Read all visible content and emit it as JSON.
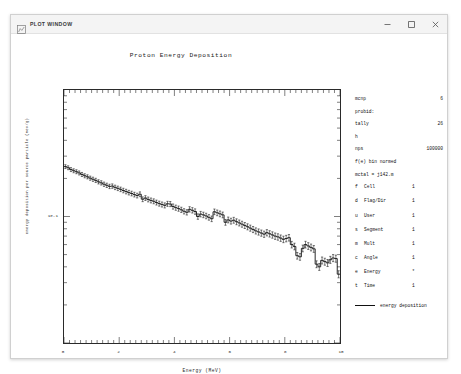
{
  "window": {
    "title": "PLOT WINDOW",
    "icon": "plot-window-icon",
    "minimize_label": "–",
    "maximize_label": "□",
    "close_label": "✕"
  },
  "info": {
    "rows": [
      {
        "key": "mcnp",
        "value": "6"
      },
      {
        "key": "probid:",
        "value": ""
      },
      {
        "key": "tally",
        "value": "26"
      },
      {
        "key": "h",
        "value": ""
      }
    ],
    "nps_key": "nps",
    "nps_value": "100000",
    "bin_norm": "f(e) bin normed",
    "mctal": "mctal = j142.m",
    "table": [
      {
        "code": "f",
        "name": "Cell",
        "value": "1"
      },
      {
        "code": "d",
        "name": "Flag/Dir",
        "value": "1"
      },
      {
        "code": "u",
        "name": "User",
        "value": "1"
      },
      {
        "code": "s",
        "name": "Segment",
        "value": "1"
      },
      {
        "code": "m",
        "name": "Mult",
        "value": "1"
      },
      {
        "code": "c",
        "name": "Angle",
        "value": "1"
      },
      {
        "code": "e",
        "name": "Energy",
        "value": "*"
      },
      {
        "code": "t",
        "name": "Time",
        "value": "1"
      }
    ],
    "legend_label": "energy deposition"
  },
  "chart_data": {
    "type": "line",
    "title": "Proton Energy Deposition",
    "xlabel": "Energy (MeV)",
    "ylabel": "energy deposition per source particle (MeV/g)",
    "xlim": [
      0,
      10
    ],
    "ylim_log": [
      -2,
      0
    ],
    "yscale": "log",
    "xscale": "linear",
    "grid": false,
    "xticks": [
      0,
      2,
      4,
      6,
      8,
      10
    ],
    "xtick_labels": [
      "0",
      "2",
      "4",
      "6",
      "8",
      "10"
    ],
    "ytick_labels": [
      "1e-1"
    ],
    "ytick_values": [
      0.1
    ],
    "legend": [
      "energy deposition"
    ],
    "legend_position": "right",
    "series": [
      {
        "name": "energy deposition",
        "style": "step",
        "color": "#111111",
        "error_bars": true,
        "x": [
          0.1,
          0.2,
          0.3,
          0.4,
          0.5,
          0.6,
          0.7,
          0.8,
          0.9,
          1.0,
          1.1,
          1.2,
          1.3,
          1.4,
          1.5,
          1.6,
          1.7,
          1.8,
          1.9,
          2.0,
          2.1,
          2.2,
          2.3,
          2.4,
          2.5,
          2.6,
          2.7,
          2.8,
          2.9,
          3.0,
          3.1,
          3.2,
          3.3,
          3.4,
          3.5,
          3.6,
          3.7,
          3.8,
          3.9,
          4.0,
          4.1,
          4.2,
          4.3,
          4.4,
          4.5,
          4.6,
          4.7,
          4.8,
          4.9,
          5.0,
          5.1,
          5.2,
          5.3,
          5.4,
          5.5,
          5.6,
          5.7,
          5.8,
          5.9,
          6.0,
          6.1,
          6.2,
          6.3,
          6.4,
          6.5,
          6.6,
          6.7,
          6.8,
          6.9,
          7.0,
          7.1,
          7.2,
          7.3,
          7.4,
          7.5,
          7.6,
          7.7,
          7.8,
          7.9,
          8.0,
          8.1,
          8.2,
          8.3,
          8.4,
          8.5,
          8.6,
          8.7,
          8.8,
          8.9,
          9.0,
          9.1,
          9.2,
          9.3,
          9.4,
          9.5,
          9.6,
          9.7,
          9.8,
          9.9,
          10.0
        ],
        "y": [
          0.248,
          0.243,
          0.235,
          0.23,
          0.226,
          0.221,
          0.215,
          0.21,
          0.206,
          0.201,
          0.197,
          0.193,
          0.188,
          0.1845,
          0.18,
          0.1765,
          0.173,
          0.174,
          0.17,
          0.167,
          0.164,
          0.1605,
          0.1575,
          0.1545,
          0.152,
          0.149,
          0.1465,
          0.15,
          0.137,
          0.14,
          0.1365,
          0.134,
          0.132,
          0.129,
          0.1265,
          0.1245,
          0.1225,
          0.126,
          0.1255,
          0.12,
          0.1175,
          0.1155,
          0.113,
          0.11,
          0.108,
          0.114,
          0.112,
          0.1095,
          0.1,
          0.1045,
          0.103,
          0.101,
          0.0985,
          0.096,
          0.109,
          0.107,
          0.105,
          0.103,
          0.09,
          0.094,
          0.092,
          0.0935,
          0.091,
          0.089,
          0.087,
          0.085,
          0.083,
          0.081,
          0.079,
          0.077,
          0.0755,
          0.074,
          0.0725,
          0.0745,
          0.073,
          0.0715,
          0.07,
          0.069,
          0.0675,
          0.066,
          0.067,
          0.068,
          0.06,
          0.058,
          0.049,
          0.048,
          0.056,
          0.06,
          0.0585,
          0.057,
          0.0555,
          0.042,
          0.04,
          0.045,
          0.044,
          0.043,
          0.0455,
          0.047,
          0.0465,
          0.035
        ]
      }
    ]
  }
}
